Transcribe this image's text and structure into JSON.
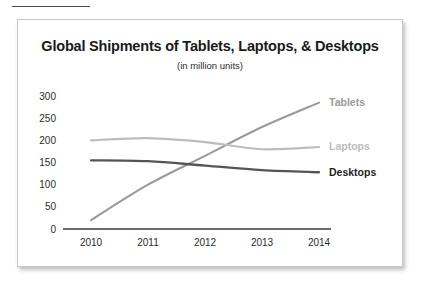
{
  "chart_data": {
    "type": "line",
    "title": "Global Shipments of Tablets, Laptops, & Desktops",
    "subtitle": "(in million units)",
    "xlabel": "",
    "ylabel": "",
    "categories": [
      "2010",
      "2011",
      "2012",
      "2013",
      "2014"
    ],
    "x": [
      2010,
      2011,
      2012,
      2013,
      2014
    ],
    "ylim": [
      0,
      300
    ],
    "yticks": [
      "0",
      "50",
      "100",
      "150",
      "200",
      "250",
      "300"
    ],
    "ytick_values": [
      0,
      50,
      100,
      150,
      200,
      250,
      300
    ],
    "grid": false,
    "legend_position": "right-inline",
    "series": [
      {
        "name": "Tablets",
        "values": [
          20,
          100,
          165,
          230,
          285
        ],
        "color": "#9a9a9a"
      },
      {
        "name": "Laptops",
        "values": [
          200,
          205,
          196,
          180,
          185
        ],
        "color": "#bcbcbc"
      },
      {
        "name": "Desktops",
        "values": [
          155,
          153,
          143,
          133,
          128
        ],
        "color": "#555555"
      }
    ]
  },
  "axis": {
    "baseline_color": "#3a3a3a"
  },
  "frame": {
    "border_color": "#c9c9c9",
    "background": "#ffffff"
  }
}
